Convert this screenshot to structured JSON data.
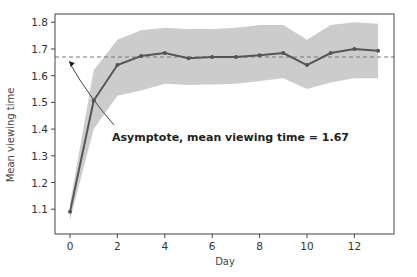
{
  "chart_data": {
    "type": "line",
    "title": "",
    "xlabel": "Day",
    "ylabel": "Mean viewing time",
    "x": [
      0,
      1,
      2,
      3,
      4,
      5,
      6,
      7,
      8,
      9,
      10,
      11,
      12,
      13
    ],
    "series": [
      {
        "name": "Mean viewing time",
        "values": [
          1.09,
          1.507,
          1.64,
          1.674,
          1.685,
          1.665,
          1.67,
          1.67,
          1.677,
          1.685,
          1.64,
          1.685,
          1.7,
          1.693
        ],
        "color": "#555555",
        "marker": "circle"
      }
    ],
    "confidence_band": {
      "lower": [
        1.06,
        1.4,
        1.525,
        1.545,
        1.57,
        1.565,
        1.567,
        1.57,
        1.58,
        1.59,
        1.55,
        1.575,
        1.59,
        1.59
      ],
      "upper": [
        1.12,
        1.62,
        1.735,
        1.77,
        1.78,
        1.775,
        1.775,
        1.78,
        1.79,
        1.79,
        1.735,
        1.79,
        1.8,
        1.795
      ],
      "color": "#cccccc"
    },
    "reference_line": {
      "y": 1.67,
      "style": "dashed",
      "color": "#777777"
    },
    "annotation": {
      "text": "Asymptote, mean viewing time = 1.67",
      "arrow_to": [
        -0.05,
        1.655
      ]
    },
    "xticks": [
      0,
      2,
      4,
      6,
      8,
      10,
      12
    ],
    "yticks": [
      1.1,
      1.2,
      1.3,
      1.4,
      1.5,
      1.6,
      1.7,
      1.8
    ],
    "xlim": [
      -0.6,
      13.6
    ],
    "ylim": [
      1.01,
      1.83
    ],
    "grid": false,
    "legend": null
  }
}
